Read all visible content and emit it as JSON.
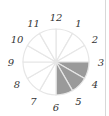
{
  "diagram": {
    "type": "fraction-circle",
    "sectors_total": 12,
    "shaded_sectors": [
      4,
      5,
      6
    ],
    "labels": [
      "1",
      "2",
      "3",
      "4",
      "5",
      "6",
      "7",
      "8",
      "9",
      "10",
      "11",
      "12"
    ],
    "colors": {
      "shaded": "#9a9a9a",
      "unshaded": "#ffffff",
      "stroke": "#e6e6e6",
      "label": "#333333"
    }
  }
}
